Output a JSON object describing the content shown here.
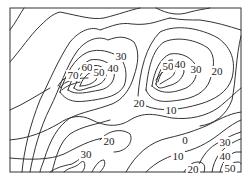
{
  "figure": {
    "type": "contour-map",
    "frame": {
      "x": 10,
      "y": 8,
      "width": 231,
      "height": 164,
      "stroke": "#333333"
    },
    "background": "#ffffff",
    "line_color": "#333333"
  },
  "labels": [
    {
      "id": "peak-left-70",
      "text": "70",
      "x": 73,
      "y": 79
    },
    {
      "id": "peak-left-60",
      "text": "60",
      "x": 87,
      "y": 71
    },
    {
      "id": "peak-left-50",
      "text": "50",
      "x": 99,
      "y": 76
    },
    {
      "id": "peak-left-40",
      "text": "40",
      "x": 113,
      "y": 72
    },
    {
      "id": "top-30",
      "text": "30",
      "x": 121,
      "y": 60
    },
    {
      "id": "peak-right-50",
      "text": "50",
      "x": 168,
      "y": 70
    },
    {
      "id": "peak-right-40",
      "text": "40",
      "x": 180,
      "y": 68
    },
    {
      "id": "peak-right-30",
      "text": "30",
      "x": 196,
      "y": 73
    },
    {
      "id": "right-20",
      "text": "20",
      "x": 217,
      "y": 75
    },
    {
      "id": "mid-20",
      "text": "20",
      "x": 139,
      "y": 107
    },
    {
      "id": "mid-10",
      "text": "10",
      "x": 171,
      "y": 114
    },
    {
      "id": "valley-0",
      "text": "0",
      "x": 185,
      "y": 144
    },
    {
      "id": "low-10",
      "text": "10",
      "x": 178,
      "y": 160
    },
    {
      "id": "low-20",
      "text": "20",
      "x": 193,
      "y": 173
    },
    {
      "id": "lower-left-20",
      "text": "20",
      "x": 109,
      "y": 145
    },
    {
      "id": "lower-left-30",
      "text": "30",
      "x": 86,
      "y": 158
    },
    {
      "id": "corner-30",
      "text": "30",
      "x": 225,
      "y": 146
    },
    {
      "id": "corner-40",
      "text": "40",
      "x": 225,
      "y": 160
    },
    {
      "id": "corner-50",
      "text": "50",
      "x": 230,
      "y": 172
    }
  ],
  "contour_levels": [
    0,
    10,
    20,
    30,
    40,
    50,
    60,
    70
  ]
}
